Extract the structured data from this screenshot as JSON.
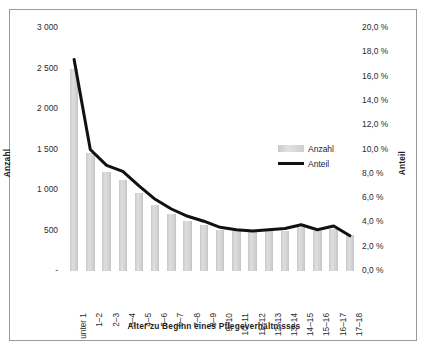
{
  "chart_data": {
    "type": "bar",
    "title": "",
    "xlabel": "Alter zu Beginn eines Pflegeverhältnisses",
    "ylabel": "Anzahl",
    "y2label": "Anteil",
    "categories": [
      "unter 1",
      "1–2",
      "2–3",
      "3–4",
      "4–5",
      "5–6",
      "6–7",
      "7–8",
      "8–9",
      "9–10",
      "10–11",
      "11–12",
      "12–13",
      "13–14",
      "14–15",
      "15–16",
      "16–17",
      "17–18"
    ],
    "series": [
      {
        "name": "Anzahl",
        "type": "bar",
        "axis": "left",
        "color": "#d4d4d4",
        "values": [
          2500,
          1460,
          1220,
          1120,
          960,
          810,
          700,
          620,
          570,
          510,
          490,
          480,
          490,
          500,
          540,
          500,
          520,
          450
        ]
      },
      {
        "name": "Anteil",
        "type": "line",
        "axis": "right",
        "color": "#111111",
        "values": [
          17.4,
          10.0,
          8.7,
          8.2,
          7.0,
          5.9,
          5.1,
          4.5,
          4.1,
          3.6,
          3.4,
          3.3,
          3.4,
          3.5,
          3.8,
          3.4,
          3.7,
          2.9
        ]
      }
    ],
    "ylim": [
      0,
      3000
    ],
    "y2lim": [
      0,
      20
    ],
    "yticks": [
      "-",
      "500",
      "1 000",
      "1 500",
      "2 000",
      "2 500",
      "3 000"
    ],
    "ytick_values": [
      0,
      500,
      1000,
      1500,
      2000,
      2500,
      3000
    ],
    "y2ticks": [
      "0,0 %",
      "2,0 %",
      "4,0 %",
      "6,0 %",
      "8,0 %",
      "10,0 %",
      "12,0 %",
      "14,0 %",
      "16,0 %",
      "18,0 %",
      "20,0 %"
    ],
    "y2tick_values": [
      0,
      2,
      4,
      6,
      8,
      10,
      12,
      14,
      16,
      18,
      20
    ],
    "grid": false,
    "legend": {
      "position": "inside-right",
      "entries": [
        {
          "label": "Anzahl",
          "marker": "bar-swatch"
        },
        {
          "label": "Anteil",
          "marker": "line-swatch"
        }
      ]
    }
  }
}
